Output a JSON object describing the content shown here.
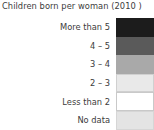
{
  "legend": {
    "title": "Children born per woman (2010 )",
    "background_color": "#ffffff",
    "text_color": "#3c3c3c",
    "rows": [
      {
        "label": "More than 5",
        "color": "#1c1c1c",
        "border_color": "#1c1c1c"
      },
      {
        "label": "4 – 5",
        "color": "#5a5a5a",
        "border_color": "#5a5a5a"
      },
      {
        "label": "3 – 4",
        "color": "#a9a9a9",
        "border_color": "#a9a9a9"
      },
      {
        "label": "2 – 3",
        "color": "#e9e9e9",
        "border_color": "#d0d0d0"
      },
      {
        "label": "Less than 2",
        "color": "#ffffff",
        "border_color": "#c9c9c9"
      },
      {
        "label": "No data",
        "color": "#e4e4e4",
        "border_color": "#d6d6d6"
      }
    ]
  },
  "chart_data": {
    "type": "table",
    "title": "Children born per woman (2010 )",
    "categories": [
      "More than 5",
      "4 – 5",
      "3 – 4",
      "2 – 3",
      "Less than 2",
      "No data"
    ],
    "values": [
      "#1c1c1c",
      "#5a5a5a",
      "#a9a9a9",
      "#e9e9e9",
      "#ffffff",
      "#e4e4e4"
    ],
    "xlabel": "",
    "ylabel": "",
    "legend_position": "standalone",
    "grid": false
  }
}
